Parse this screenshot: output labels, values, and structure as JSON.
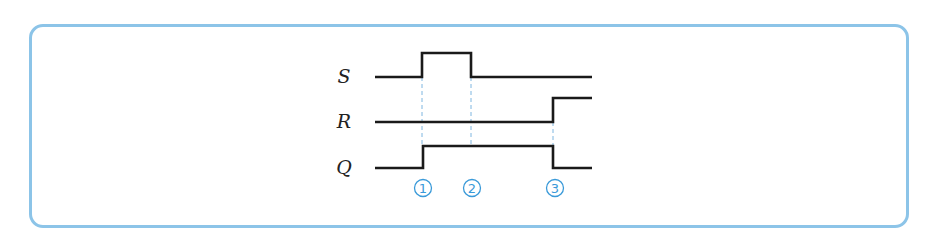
{
  "diagram": {
    "type": "timing-diagram",
    "frame_color": "#8cc4e8",
    "accent_color": "#3a9ad9",
    "x_start": 375,
    "x_end": 592,
    "signals": [
      {
        "name": "S",
        "label_x": 344,
        "high_y": 53,
        "low_y": 77,
        "points": [
          [
            375,
            77
          ],
          [
            422,
            77
          ],
          [
            422,
            53
          ],
          [
            471,
            53
          ],
          [
            471,
            77
          ],
          [
            592,
            77
          ]
        ]
      },
      {
        "name": "R",
        "label_x": 344,
        "high_y": 98,
        "low_y": 122,
        "points": [
          [
            375,
            122
          ],
          [
            553,
            122
          ],
          [
            553,
            98
          ],
          [
            592,
            98
          ]
        ]
      },
      {
        "name": "Q",
        "label_x": 344,
        "high_y": 146,
        "low_y": 168,
        "points": [
          [
            375,
            168
          ],
          [
            423,
            168
          ],
          [
            423,
            146
          ],
          [
            553,
            146
          ],
          [
            553,
            168
          ],
          [
            592,
            168
          ]
        ]
      }
    ],
    "guides": [
      {
        "x": 422,
        "y1": 77,
        "y2": 146
      },
      {
        "x": 471,
        "y1": 77,
        "y2": 146
      },
      {
        "x": 553,
        "y1": 122,
        "y2": 146
      }
    ],
    "markers": [
      {
        "label": "1",
        "x": 423,
        "y": 188
      },
      {
        "label": "2",
        "x": 472,
        "y": 188
      },
      {
        "label": "3",
        "x": 555,
        "y": 188
      }
    ]
  }
}
